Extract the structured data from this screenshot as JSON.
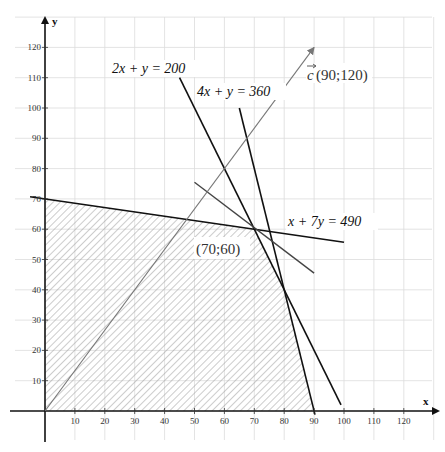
{
  "chart_data": {
    "type": "line",
    "title": "",
    "xlabel": "x",
    "ylabel": "y",
    "xlim": [
      -10,
      130
    ],
    "ylim": [
      -10,
      130
    ],
    "grid": true,
    "x_ticks": [
      10,
      20,
      30,
      40,
      50,
      60,
      70,
      80,
      90,
      100,
      110,
      120
    ],
    "y_ticks": [
      10,
      20,
      30,
      40,
      50,
      60,
      70,
      80,
      90,
      100,
      110,
      120
    ],
    "series": [
      {
        "name": "2x + y = 200",
        "label": "2x + y = 200",
        "points": [
          [
            45,
            110
          ],
          [
            99,
            2
          ]
        ],
        "color": "#111111"
      },
      {
        "name": "4x + y = 360",
        "label": "4x + y = 360",
        "points": [
          [
            65,
            100
          ],
          [
            90.3,
            -1.2
          ]
        ],
        "color": "#111111"
      },
      {
        "name": "x + 7y = 490",
        "label": "x + 7y = 490",
        "points": [
          [
            -5,
            70.7
          ],
          [
            100,
            55.7
          ]
        ],
        "color": "#111111"
      },
      {
        "name": "level line",
        "label": "",
        "points": [
          [
            50,
            75.5
          ],
          [
            90,
            45.5
          ]
        ],
        "color": "#444444"
      },
      {
        "name": "vector c",
        "label": "c(90;120)",
        "points": [
          [
            0,
            0
          ],
          [
            90,
            120
          ]
        ],
        "color": "#777777",
        "arrow": true
      }
    ],
    "feasible_region": {
      "label": "shaded feasible region",
      "vertices": [
        [
          0,
          0
        ],
        [
          0,
          70
        ],
        [
          70,
          60
        ],
        [
          80,
          40
        ],
        [
          90,
          0
        ]
      ],
      "fill": "hatched"
    },
    "annotations": [
      {
        "text": "(70;60)",
        "x": 70,
        "y": 60
      },
      {
        "text": "c(90;120)",
        "x": 90,
        "y": 120
      }
    ]
  },
  "labels": {
    "x_axis": "x",
    "y_axis": "y",
    "eq1": "2x + y = 200",
    "eq2": "4x + y = 360",
    "eq3": "x + 7y = 490",
    "vector": "(90;120)",
    "vector_symbol": "c",
    "optimum": "(70;60)"
  }
}
